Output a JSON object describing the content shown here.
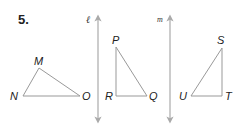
{
  "problem": {
    "number": "5."
  },
  "lines": [
    {
      "name": "ℓ",
      "x": 98,
      "y1": 15,
      "y2": 122,
      "label_x": 86,
      "label_y": 23
    },
    {
      "name": "m",
      "x": 170,
      "y1": 15,
      "y2": 122,
      "label_x": 158,
      "label_y": 22
    }
  ],
  "triangles": [
    {
      "name": "MNO",
      "vertices": [
        {
          "label": "M",
          "x": 39,
          "y": 68,
          "lx": 34,
          "ly": 64
        },
        {
          "label": "N",
          "x": 23,
          "y": 96,
          "lx": 10,
          "ly": 100
        },
        {
          "label": "O",
          "x": 80,
          "y": 96,
          "lx": 82,
          "ly": 100
        }
      ]
    },
    {
      "name": "PQR",
      "vertices": [
        {
          "label": "P",
          "x": 116,
          "y": 47,
          "lx": 112,
          "ly": 43
        },
        {
          "label": "R",
          "x": 116,
          "y": 96,
          "lx": 105,
          "ly": 100
        },
        {
          "label": "Q",
          "x": 147,
          "y": 96,
          "lx": 149,
          "ly": 100
        }
      ]
    },
    {
      "name": "STU",
      "vertices": [
        {
          "label": "S",
          "x": 222,
          "y": 48,
          "lx": 217,
          "ly": 44
        },
        {
          "label": "T",
          "x": 222,
          "y": 96,
          "lx": 225,
          "ly": 100
        },
        {
          "label": "U",
          "x": 191,
          "y": 96,
          "lx": 179,
          "ly": 100
        }
      ]
    }
  ],
  "colors": {
    "line": "#aaaaaa",
    "triangle": "#999999",
    "text": "#222222"
  }
}
